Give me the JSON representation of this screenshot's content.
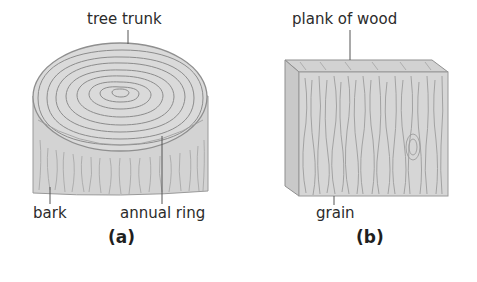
{
  "diagram": {
    "panel_a": {
      "caption": "(a)",
      "labels": {
        "top": "tree trunk",
        "bottom_left": "bark",
        "bottom_right": "annual ring"
      }
    },
    "panel_b": {
      "caption": "(b)",
      "labels": {
        "top": "plank of wood",
        "bottom": "grain"
      }
    },
    "colors": {
      "wood_fill": "#d6d6d6",
      "wood_top": "#dcdcdc",
      "lines": "#8a8a8a",
      "text": "#2b2b2b"
    }
  }
}
